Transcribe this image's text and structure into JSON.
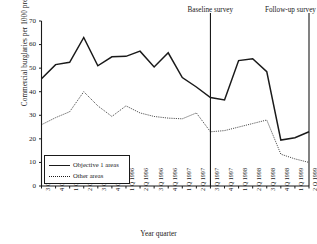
{
  "chart_data": {
    "type": "line",
    "title": "",
    "xlabel": "Year quarter",
    "ylabel": "Commercial burglaries per 1000 premises",
    "ylim": [
      0,
      70
    ],
    "yticks": [
      0,
      10,
      20,
      30,
      40,
      50,
      60,
      70
    ],
    "grid": false,
    "legend_position": "lower-left-inside",
    "categories": [
      "3 Q 1994",
      "4 Q 1994",
      "1 Q 1995",
      "2 Q 1995",
      "3 Q 1995",
      "4 Q 1995",
      "1 Q 1996",
      "2 Q 1996",
      "3 Q 1996",
      "4 Q 1996",
      "1 Q 1997",
      "2 Q 1997",
      "3 Q 1997",
      "4 Q 1997",
      "1 Q 1998",
      "2 Q 1998",
      "3 Q 1998",
      "4 Q 1998",
      "1 Q 1999",
      "2 Q 1999"
    ],
    "series": [
      {
        "name": "Objective 1 areas",
        "style": "solid",
        "color": "#1a1a1a",
        "values": [
          45.5,
          51.5,
          52.5,
          63.0,
          51.0,
          54.8,
          55.0,
          57.2,
          50.5,
          56.5,
          46.0,
          42.0,
          37.5,
          36.5,
          53.2,
          54.0,
          48.5,
          19.5,
          20.5,
          23.0
        ]
      },
      {
        "name": "Other areas",
        "style": "dotted",
        "color": "#1a1a1a",
        "values": [
          26.0,
          29.0,
          31.5,
          40.0,
          34.0,
          29.5,
          34.0,
          31.0,
          29.5,
          28.8,
          28.5,
          31.0,
          23.0,
          23.5,
          25.0,
          26.5,
          28.0,
          13.5,
          11.5,
          10.0
        ]
      }
    ],
    "annotations": [
      {
        "label": "Baseline survey",
        "at_category": "3 Q 1997",
        "type": "vertical-line"
      },
      {
        "label": "Follow-up survey",
        "at_category": "2 Q 1999",
        "type": "vertical-line"
      }
    ]
  },
  "legend": {
    "items": [
      {
        "label": "Objective 1 areas",
        "style": "solid"
      },
      {
        "label": "Other areas",
        "style": "dotted"
      }
    ]
  },
  "axes": {
    "y_title": "Commercial burglaries per 1000 premises",
    "x_title": "Year quarter"
  }
}
